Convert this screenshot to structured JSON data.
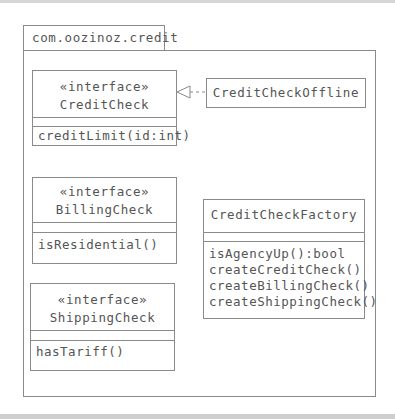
{
  "package": {
    "name": "com.oozinoz.credit"
  },
  "classes": {
    "credit_check": {
      "stereotype": "«interface»",
      "name": "CreditCheck",
      "operations": [
        "creditLimit(id:int)"
      ]
    },
    "credit_check_offline": {
      "name": "CreditCheckOffline"
    },
    "billing_check": {
      "stereotype": "«interface»",
      "name": "BillingCheck",
      "operations": [
        "isResidential()"
      ]
    },
    "credit_check_factory": {
      "name": "CreditCheckFactory",
      "operations": [
        "isAgencyUp():bool",
        "createCreditCheck()",
        "createBillingCheck()",
        "createShippingCheck()"
      ]
    },
    "shipping_check": {
      "stereotype": "«interface»",
      "name": "ShippingCheck",
      "operations": [
        "hasTariff()"
      ]
    }
  },
  "relations": [
    {
      "type": "realization",
      "from": "CreditCheckOffline",
      "to": "CreditCheck"
    }
  ],
  "colors": {
    "line": "#8a8a8a",
    "text": "#555555",
    "band": "#d6d6d6"
  }
}
